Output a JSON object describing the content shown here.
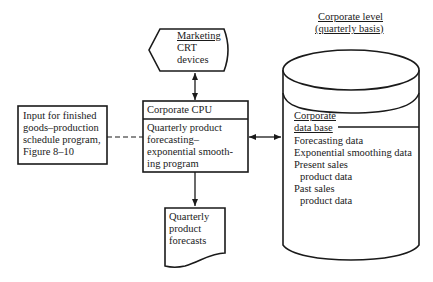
{
  "diagram": {
    "title": {
      "line1": "Corporate level",
      "line2": "(quarterly basis)"
    },
    "marketing_display": {
      "line1": "Marketing",
      "line2": "CRT",
      "line3": "devices"
    },
    "cpu": {
      "header": "Corporate CPU",
      "line1": "Quarterly product",
      "line2": "forecasting–",
      "line3": "exponential smooth-",
      "line4": "ing program"
    },
    "input_box": {
      "line1": "Input for finished",
      "line2": "goods–production",
      "line3": "schedule program,",
      "line4": "Figure 8–10"
    },
    "report": {
      "line1": "Quarterly",
      "line2": "product",
      "line3": "forecasts"
    },
    "database": {
      "title1": "Corporate",
      "title2": "data base",
      "items": [
        "Forecasting data",
        "Exponential smoothing data",
        "Present sales",
        "product data",
        "Past sales",
        "product data"
      ]
    },
    "connections": [
      {
        "from": "marketing_display",
        "to": "cpu",
        "style": "solid",
        "arrows": "both"
      },
      {
        "from": "input_box",
        "to": "cpu",
        "style": "dashed",
        "arrows": "none"
      },
      {
        "from": "cpu",
        "to": "database",
        "style": "solid",
        "arrows": "both"
      },
      {
        "from": "cpu",
        "to": "report",
        "style": "solid",
        "arrows": "end"
      }
    ]
  }
}
